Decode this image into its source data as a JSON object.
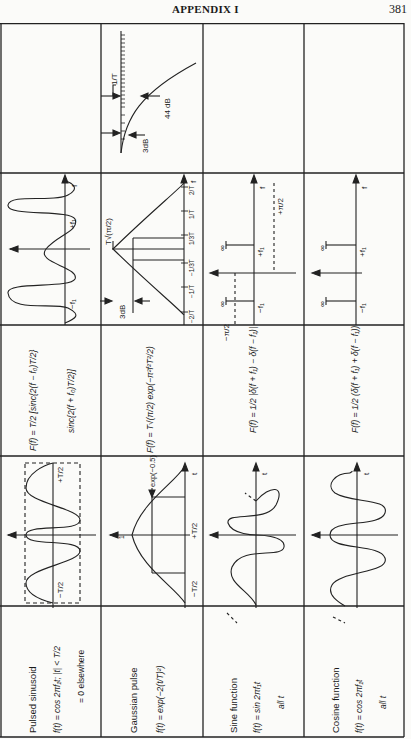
{
  "header": {
    "title": "APPENDIX I",
    "page_number": "381"
  },
  "table": {
    "orientation": "rotated 90° counter-clockwise",
    "rows": [
      {
        "name": "Pulsed sinusoid",
        "definition": [
          "f(t) = cos 2πf₁t;  |t| < T/2",
          "= 0 elsewhere"
        ],
        "time_plot_labels": [
          "−T/2",
          "+T/2"
        ],
        "spectrum": [
          "F(f) = T/2 [sinc{2(f − f₀)T/2}",
          "sinc{2(f + f₀)T/2}]"
        ],
        "spectrum_plot_labels": [
          "−f₁",
          "+f₁",
          "f"
        ],
        "detail_plot_labels": [
          "1/T",
          "3dB",
          "44 dB"
        ]
      },
      {
        "name": "Gaussian pulse",
        "definition": [
          "f(t) = exp(−2(t/T)²)"
        ],
        "time_plot_labels": [
          "1",
          "exp(−0.5)",
          "−T/2",
          "+T/2",
          "t"
        ],
        "spectrum": [
          "F(f) = T√(π/2) exp(−π²f²T²/2)"
        ],
        "spectrum_plot_labels": [
          "T√(π/2)",
          "3dB",
          "−2/T",
          "−1/T",
          "−1/3T",
          "1/3T",
          "1/T",
          "2/T",
          "f"
        ]
      },
      {
        "name": "Sine function",
        "definition": [
          "f(t) = sin 2πf₁t",
          "all t"
        ],
        "time_plot_labels": [
          "t"
        ],
        "spectrum": [
          "F(f) = 1/2 |δ(f + f₁) − δ(f − f₁)|"
        ],
        "spectrum_plot_labels": [
          "∞",
          "∞",
          "−f₁",
          "+f₁",
          "−π/2",
          "+π/2",
          "f"
        ]
      },
      {
        "name": "Cosine function",
        "definition": [
          "f(t) = cos 2πf₁t",
          "all t"
        ],
        "time_plot_labels": [
          "t"
        ],
        "spectrum": [
          "F(f) = 1/2 (δ(f + f₁) + δ(f − f₁))"
        ],
        "spectrum_plot_labels": [
          "∞",
          "∞",
          "−f₁",
          "+f₁",
          "f"
        ]
      }
    ]
  }
}
